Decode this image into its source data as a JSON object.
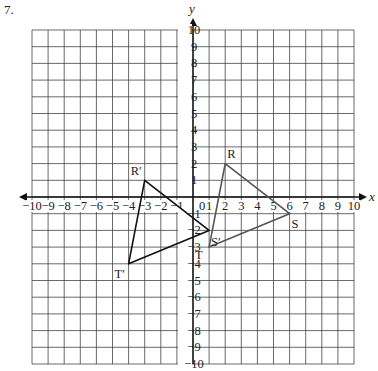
{
  "problem": {
    "number": "7."
  },
  "grid": {
    "xmin": -10,
    "xmax": 10,
    "ymin": -10,
    "ymax": 10,
    "step": 1
  },
  "axes": {
    "x_label": "x",
    "y_label": "y",
    "origin_label": "0"
  },
  "x_ticks": [
    "−10",
    "−9",
    "−8",
    "−7",
    "−6",
    "−5",
    "−4",
    "−3",
    "−2",
    "−1",
    "1",
    "2",
    "3",
    "4",
    "5",
    "6",
    "7",
    "8",
    "9",
    "10"
  ],
  "x_tick_values": [
    -10,
    -9,
    -8,
    -7,
    -6,
    -5,
    -4,
    -3,
    -2,
    -1,
    1,
    2,
    3,
    4,
    5,
    6,
    7,
    8,
    9,
    10
  ],
  "y_ticks": [
    "10",
    "9",
    "8",
    "7",
    "6",
    "5",
    "4",
    "3",
    "2",
    "1",
    "−1",
    "−2",
    "−3",
    "−4",
    "−5",
    "−6",
    "−7",
    "−8",
    "−9",
    "−10"
  ],
  "y_tick_values": [
    10,
    9,
    8,
    7,
    6,
    5,
    4,
    3,
    2,
    1,
    -1,
    -2,
    -3,
    -4,
    -5,
    -6,
    -7,
    -8,
    -9,
    -10
  ],
  "triangles": [
    {
      "name": "RST",
      "color": "#555555",
      "vertices": [
        {
          "label": "R",
          "x": 2,
          "y": 2,
          "dx": 2,
          "dy": -6
        },
        {
          "label": "S",
          "x": 6,
          "y": -1,
          "dx": 2,
          "dy": 14
        },
        {
          "label": "T",
          "x": 1,
          "y": -3,
          "dx": -14,
          "dy": 12
        }
      ]
    },
    {
      "name": "R'S'T'",
      "color": "#111111",
      "vertices": [
        {
          "label": "R′",
          "x": -3,
          "y": 1,
          "dx": -14,
          "dy": -5
        },
        {
          "label": "S′",
          "x": 1,
          "y": -2,
          "dx": 2,
          "dy": 16
        },
        {
          "label": "T′",
          "x": -4,
          "y": -4,
          "dx": -14,
          "dy": 14
        }
      ]
    }
  ],
  "colors": {
    "grid": "#444444",
    "axis": "#111111",
    "text": "#222222"
  }
}
